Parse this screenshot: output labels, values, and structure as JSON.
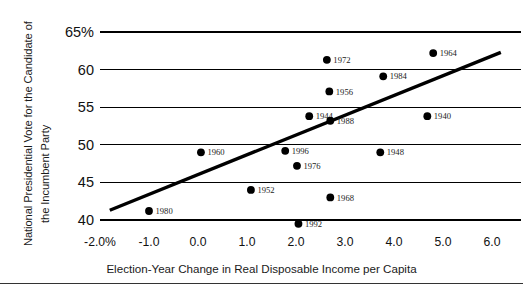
{
  "chart_data": {
    "type": "scatter",
    "title": "",
    "xlabel": "Election-Year Change in Real Disposable Income per Capita",
    "ylabel_line1": "National Presidential Vote for the Candidate of",
    "ylabel_line2": "the Incumbent Party",
    "xlim": [
      -2.0,
      6.3
    ],
    "ylim": [
      39.0,
      65.0
    ],
    "xticks": [
      -2.0,
      -1.0,
      0.0,
      1.0,
      2.0,
      3.0,
      4.0,
      5.0,
      6.0
    ],
    "xtick_labels": [
      "-2.0%",
      "-1.0",
      "0.0",
      "1.0",
      "2.0",
      "3.0",
      "4.0",
      "5.0",
      "6.0"
    ],
    "yticks": [
      40,
      45,
      50,
      55,
      60,
      65
    ],
    "ytick_labels": [
      "40",
      "45",
      "50",
      "55",
      "60",
      "65%"
    ],
    "grid": "horizontal",
    "legend": "none",
    "point_label_font": "serif",
    "points": [
      {
        "label": "1972",
        "x": 2.63,
        "y": 61.3
      },
      {
        "label": "1964",
        "x": 4.8,
        "y": 62.2
      },
      {
        "label": "1984",
        "x": 3.78,
        "y": 59.1
      },
      {
        "label": "1956",
        "x": 2.68,
        "y": 57.1
      },
      {
        "label": "1944",
        "x": 2.27,
        "y": 53.8
      },
      {
        "label": "1940",
        "x": 4.68,
        "y": 53.8
      },
      {
        "label": "1988",
        "x": 2.7,
        "y": 53.2
      },
      {
        "label": "1960",
        "x": 0.06,
        "y": 49.0
      },
      {
        "label": "1996",
        "x": 1.78,
        "y": 49.2
      },
      {
        "label": "1948",
        "x": 3.72,
        "y": 49.0
      },
      {
        "label": "1976",
        "x": 2.02,
        "y": 47.2
      },
      {
        "label": "1952",
        "x": 1.08,
        "y": 44.0
      },
      {
        "label": "1968",
        "x": 2.7,
        "y": 43.0
      },
      {
        "label": "1980",
        "x": -1.0,
        "y": 41.2
      },
      {
        "label": "1992",
        "x": 2.05,
        "y": 39.5
      }
    ],
    "trendline": {
      "x0": -1.8,
      "y0": 41.3,
      "x1": 6.18,
      "y1": 62.3
    }
  },
  "colors": {
    "line": "#000000",
    "grid": "#000000",
    "text": "#111111",
    "background": "#ffffff"
  }
}
